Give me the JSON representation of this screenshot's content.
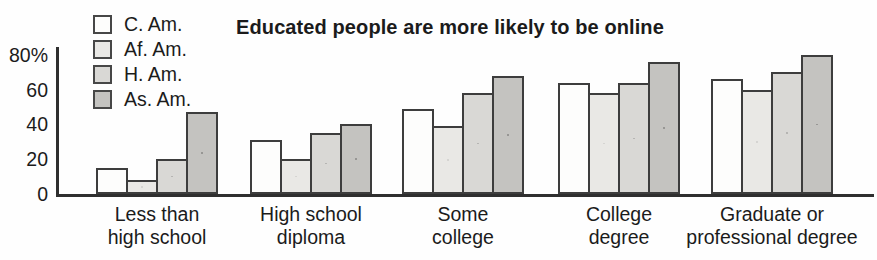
{
  "chart_data": {
    "type": "bar",
    "title": "Educated people are more likely to be online",
    "xlabel": "",
    "ylabel": "",
    "ylim": [
      0,
      83
    ],
    "grid": false,
    "legend_position": "top-left",
    "y_ticks": [
      {
        "label": "80%",
        "value": 80
      },
      {
        "label": "60",
        "value": 60
      },
      {
        "label": "40",
        "value": 40
      },
      {
        "label": "20",
        "value": 20
      },
      {
        "label": "0",
        "value": 0
      }
    ],
    "categories": [
      "Less than high school",
      "High school diploma",
      "Some college",
      "College degree",
      "Graduate or professional degree"
    ],
    "category_lines": [
      [
        "Less than",
        "high school"
      ],
      [
        "High school",
        "diploma"
      ],
      [
        "Some",
        "college"
      ],
      [
        "College",
        "degree"
      ],
      [
        "Graduate or",
        "professional degree"
      ]
    ],
    "series": [
      {
        "name": "C. Am.",
        "values": [
          15,
          31,
          49,
          64,
          66
        ],
        "fill": "#fdfdfc",
        "pattern": "none"
      },
      {
        "name": "Af. Am.",
        "values": [
          8,
          20,
          39,
          58,
          60
        ],
        "fill": "#e9e8e5",
        "pattern": "faint-dots"
      },
      {
        "name": "H. Am.",
        "values": [
          20,
          35,
          58,
          64,
          70
        ],
        "fill": "#d9d8d5",
        "pattern": "dots"
      },
      {
        "name": "As. Am.",
        "values": [
          47,
          40,
          68,
          76,
          80
        ],
        "fill": "#c4c3c0",
        "pattern": "dense-dots"
      }
    ],
    "bar_border_color": "#3d3d3d",
    "axis_color": "#2f2f2f",
    "text_color": "#1b1b1b"
  }
}
